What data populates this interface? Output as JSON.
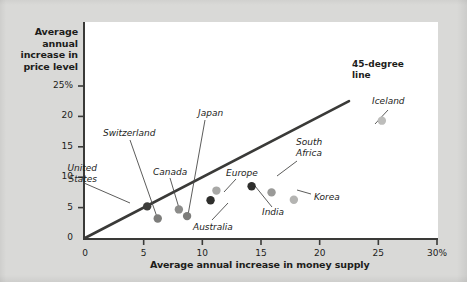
{
  "chart_data": {
    "type": "scatter",
    "title": "",
    "xlabel": "Average annual increase in money supply",
    "ylabel": "Average annual increase in price level",
    "xlim": [
      0,
      30
    ],
    "ylim": [
      0,
      27
    ],
    "grid": false,
    "legend": "none",
    "x_ticks": [
      {
        "value": 0,
        "label": "0"
      },
      {
        "value": 5,
        "label": "5"
      },
      {
        "value": 10,
        "label": "10"
      },
      {
        "value": 15,
        "label": "15"
      },
      {
        "value": 20,
        "label": "20"
      },
      {
        "value": 25,
        "label": "25"
      },
      {
        "value": 30,
        "label": "30%"
      }
    ],
    "y_ticks": [
      {
        "value": 0,
        "label": "0"
      },
      {
        "value": 5,
        "label": "5"
      },
      {
        "value": 10,
        "label": "10"
      },
      {
        "value": 15,
        "label": "15"
      },
      {
        "value": 20,
        "label": "20"
      },
      {
        "value": 25,
        "label": "25%"
      }
    ],
    "reference_line": {
      "name": "45-degree line",
      "label": "45-degree\nline",
      "label_line_1": "45-degree",
      "label_line_2": "line",
      "from": [
        0,
        0
      ],
      "to": [
        30,
        30
      ],
      "color": "#3a3a38"
    },
    "points": [
      {
        "name": "United States",
        "label": "United\nStates",
        "label_line_1": "United",
        "label_line_2": "States",
        "x": 5.3,
        "y": 5.2,
        "color": "#3d3d3b"
      },
      {
        "name": "Switzerland",
        "label": "Switzerland",
        "x": 6.2,
        "y": 3.2,
        "color": "#7d7d7b"
      },
      {
        "name": "Canada",
        "label": "Canada",
        "x": 8.0,
        "y": 4.7,
        "color": "#8c8c8a"
      },
      {
        "name": "Japan",
        "label": "Japan",
        "x": 8.7,
        "y": 3.6,
        "color": "#7d7d7b"
      },
      {
        "name": "Australia",
        "label": "Australia",
        "x": 10.7,
        "y": 6.2,
        "color": "#2e2e2c"
      },
      {
        "name": "Europe",
        "label": "Europe",
        "x": 11.2,
        "y": 7.8,
        "color": "#a8a8a6"
      },
      {
        "name": "India",
        "label": "India",
        "x": 14.2,
        "y": 8.5,
        "color": "#2e2e2c"
      },
      {
        "name": "South Africa",
        "label": "South\nAfrica",
        "label_line_1": "South",
        "label_line_2": "Africa",
        "x": 15.9,
        "y": 7.5,
        "color": "#9a9a98"
      },
      {
        "name": "Korea",
        "label": "Korea",
        "x": 17.8,
        "y": 6.3,
        "color": "#b4b4b2"
      },
      {
        "name": "Iceland",
        "label": "Iceland",
        "x": 25.3,
        "y": 19.3,
        "color": "#bdbdbb"
      }
    ]
  },
  "axis": {
    "y_title": "Average annual increase in price level",
    "x_title": "Average annual increase in money supply"
  },
  "colors": {
    "background": "#d9d9d7",
    "plot_background": "#ffffff",
    "axis": "#3a3a38",
    "text": "#1d1d1b"
  }
}
